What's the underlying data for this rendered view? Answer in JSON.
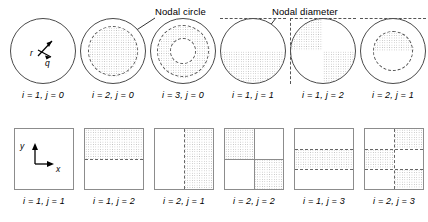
{
  "figure": {
    "annotations": {
      "nodal_circle": "Nodal circle",
      "nodal_diameter": "Nodal diameter"
    },
    "polar_axes": {
      "radial": "r",
      "angular": "q"
    },
    "cartesian_axes": {
      "x": "x",
      "y": "y"
    },
    "circular_modes": [
      {
        "caption": "i = 1, j = 0",
        "i": 1,
        "j": 0,
        "nodal_circles": 0,
        "nodal_diameters": 0
      },
      {
        "caption": "i = 2, j = 0",
        "i": 2,
        "j": 0,
        "nodal_circles": 1,
        "nodal_diameters": 0
      },
      {
        "caption": "i = 3, j = 0",
        "i": 3,
        "j": 0,
        "nodal_circles": 2,
        "nodal_diameters": 0
      },
      {
        "caption": "i = 1, j = 1",
        "i": 1,
        "j": 1,
        "nodal_circles": 0,
        "nodal_diameters": 1
      },
      {
        "caption": "i = 1, j = 2",
        "i": 1,
        "j": 2,
        "nodal_circles": 0,
        "nodal_diameters": 2
      },
      {
        "caption": "i = 2, j = 1",
        "i": 2,
        "j": 1,
        "nodal_circles": 1,
        "nodal_diameters": 1
      }
    ],
    "rectangular_modes": [
      {
        "caption": "i = 1, j = 1",
        "i": 1,
        "j": 1,
        "x_divisions": 1,
        "y_divisions": 1
      },
      {
        "caption": "i = 1, j = 2",
        "i": 1,
        "j": 2,
        "x_divisions": 1,
        "y_divisions": 2
      },
      {
        "caption": "i = 2, j = 1",
        "i": 2,
        "j": 1,
        "x_divisions": 2,
        "y_divisions": 1
      },
      {
        "caption": "i = 2, j = 2",
        "i": 2,
        "j": 2,
        "x_divisions": 2,
        "y_divisions": 2
      },
      {
        "caption": "i = 1, j = 3",
        "i": 1,
        "j": 3,
        "x_divisions": 1,
        "y_divisions": 3
      },
      {
        "caption": "i = 2, j = 3",
        "i": 2,
        "j": 3,
        "x_divisions": 2,
        "y_divisions": 3
      }
    ],
    "colors": {
      "outline": "#4a4a4a",
      "nodal_line": "#555555",
      "plate_outline": "#8c8c8c",
      "stipple": "#b9b9b9",
      "text": "#000000"
    }
  }
}
